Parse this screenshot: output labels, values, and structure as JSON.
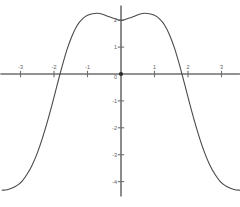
{
  "chart_data": {
    "type": "line",
    "title": "",
    "subtitle": "",
    "xlabel": "",
    "ylabel": "",
    "xlim": [
      -3.6,
      3.55
    ],
    "ylim": [
      -4.55,
      2.55
    ],
    "grid": false,
    "legend": null,
    "axis_color": "#6e6e6e",
    "curve_color": "#4a4a4a",
    "background_color": "#ffffff",
    "x_ticks": [
      {
        "value": -3,
        "label": "-3"
      },
      {
        "value": -2,
        "label": "-2"
      },
      {
        "value": -1,
        "label": "-1"
      },
      {
        "value": 1,
        "label": "1"
      },
      {
        "value": 2,
        "label": "2"
      },
      {
        "value": 3,
        "label": "3"
      }
    ],
    "y_ticks": [
      {
        "value": 2,
        "label": "2"
      },
      {
        "value": 1,
        "label": "1"
      },
      {
        "value": -1,
        "label": "-1"
      },
      {
        "value": -2,
        "label": "-2"
      },
      {
        "value": -3,
        "label": "-3"
      },
      {
        "value": -4,
        "label": "-4"
      }
    ],
    "origin_label": "0",
    "origin_marker": true,
    "annotations": [],
    "series": [
      {
        "name": "curve",
        "x": [
          -3.55,
          -3.4,
          -3.25,
          -3.1,
          -2.95,
          -2.8,
          -2.65,
          -2.5,
          -2.35,
          -2.2,
          -2.05,
          -1.9,
          -1.75,
          -1.6,
          -1.45,
          -1.3,
          -1.15,
          -1.0,
          -0.85,
          -0.7,
          -0.55,
          -0.4,
          -0.25,
          -0.1,
          0.0,
          0.1,
          0.25,
          0.4,
          0.55,
          0.7,
          0.85,
          1.0,
          1.15,
          1.3,
          1.45,
          1.6,
          1.75,
          1.9,
          2.05,
          2.2,
          2.35,
          2.5,
          2.65,
          2.8,
          2.95,
          3.1,
          3.25,
          3.4,
          3.55
        ],
        "y": [
          -4.32,
          -4.3,
          -4.24,
          -4.14,
          -3.98,
          -3.72,
          -3.38,
          -2.94,
          -2.4,
          -1.78,
          -1.1,
          -0.38,
          0.32,
          0.95,
          1.45,
          1.82,
          2.05,
          2.18,
          2.24,
          2.26,
          2.22,
          2.15,
          2.08,
          2.02,
          2.0,
          2.02,
          2.08,
          2.15,
          2.22,
          2.26,
          2.24,
          2.18,
          2.05,
          1.82,
          1.45,
          0.95,
          0.32,
          -0.38,
          -1.1,
          -1.78,
          -2.4,
          -2.94,
          -3.38,
          -3.72,
          -3.98,
          -4.14,
          -4.24,
          -4.3,
          -4.32
        ]
      }
    ]
  },
  "plot": {
    "width": 240,
    "height": 207,
    "origin_px": {
      "x": 121,
      "y": 74
    },
    "scale_px": {
      "x": 33.5,
      "y": 26.9
    }
  }
}
